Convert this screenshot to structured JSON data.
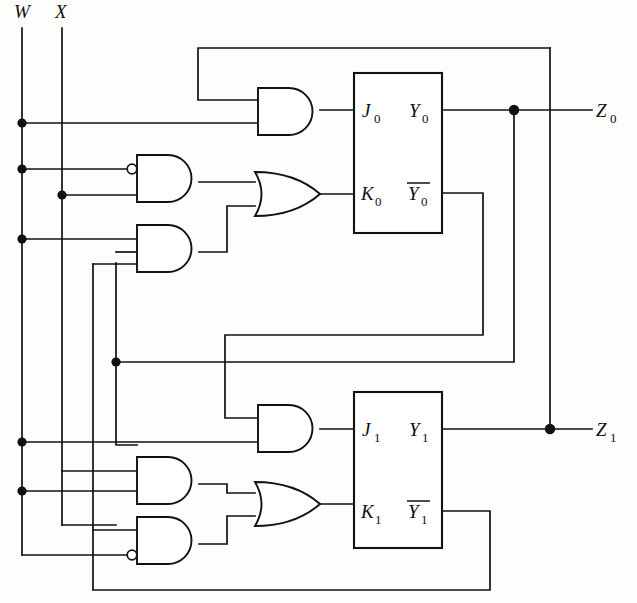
{
  "diagram": {
    "type": "logic-schematic",
    "background_color": "#fdfdfb",
    "line_color": "#111111"
  },
  "inputs": [
    {
      "id": "W",
      "label": "W",
      "x": 22,
      "label_x": 14,
      "label_y": 18
    },
    {
      "id": "X",
      "label": "X",
      "x": 62,
      "label_x": 55,
      "label_y": 18
    }
  ],
  "outputs": [
    {
      "id": "Z0",
      "label": "Z",
      "sub": "0",
      "x": 592,
      "y": 110
    },
    {
      "id": "Z1",
      "label": "Z",
      "sub": "1",
      "x": 592,
      "y": 429
    }
  ],
  "flipflops": [
    {
      "id": "ff0",
      "index": "0",
      "pins": {
        "j": "J",
        "j_sub": "0",
        "k": "K",
        "k_sub": "0",
        "q": "Y",
        "q_sub": "0",
        "qbar": "Y",
        "qbar_sub": "0",
        "qbar_overbar": true
      },
      "box": {
        "x": 354,
        "y": 73,
        "w": 88,
        "h": 160
      },
      "pin_y": {
        "j": 110,
        "k": 193,
        "q": 110,
        "qbar": 193
      }
    },
    {
      "id": "ff1",
      "index": "1",
      "pins": {
        "j": "J",
        "j_sub": "1",
        "k": "K",
        "k_sub": "1",
        "q": "Y",
        "q_sub": "1",
        "qbar": "Y",
        "qbar_sub": "1",
        "qbar_overbar": true
      },
      "box": {
        "x": 354,
        "y": 392,
        "w": 88,
        "h": 156
      },
      "pin_y": {
        "j": 429,
        "k": 511,
        "q": 429,
        "qbar": 511
      }
    }
  ],
  "gates": [
    {
      "id": "and-j0",
      "type": "AND",
      "x": 258,
      "y": 88,
      "w": 62,
      "h": 47,
      "inverted_inputs": [],
      "out_to": "J0"
    },
    {
      "id": "and-a",
      "type": "AND",
      "x": 137,
      "y": 155,
      "w": 62,
      "h": 47,
      "inverted_inputs": [
        "top"
      ],
      "out_to": "or-k0"
    },
    {
      "id": "and-b",
      "type": "AND",
      "x": 137,
      "y": 225,
      "w": 62,
      "h": 47,
      "inverted_inputs": [],
      "out_to": "or-k0"
    },
    {
      "id": "or-k0",
      "type": "OR",
      "x": 255,
      "y": 172,
      "w": 65,
      "h": 44,
      "inverted_inputs": [],
      "out_to": "K0"
    },
    {
      "id": "and-j1",
      "type": "AND",
      "x": 258,
      "y": 405,
      "w": 62,
      "h": 47,
      "inverted_inputs": [],
      "out_to": "J1"
    },
    {
      "id": "and-c",
      "type": "AND",
      "x": 137,
      "y": 457,
      "w": 62,
      "h": 47,
      "inverted_inputs": [],
      "out_to": "or-k1"
    },
    {
      "id": "and-d",
      "type": "AND",
      "x": 137,
      "y": 517,
      "w": 62,
      "h": 47,
      "inverted_inputs": [
        "bottom"
      ],
      "out_to": "or-k1"
    },
    {
      "id": "or-k1",
      "type": "OR",
      "x": 255,
      "y": 482,
      "w": 65,
      "h": 44,
      "inverted_inputs": [],
      "out_to": "K1"
    }
  ],
  "junctions": [
    {
      "id": "w-j0",
      "x": 22,
      "y": 123
    },
    {
      "id": "w-j1",
      "x": 22,
      "y": 169
    },
    {
      "id": "w-j2",
      "x": 22,
      "y": 239
    },
    {
      "id": "w-j3",
      "x": 22,
      "y": 442
    },
    {
      "id": "w-j4",
      "x": 22,
      "y": 491
    },
    {
      "id": "x-j0",
      "x": 62,
      "y": 195
    },
    {
      "id": "fb-y0",
      "x": 116,
      "y": 362
    },
    {
      "id": "z0-tap",
      "x": 514,
      "y": 110
    },
    {
      "id": "z1-tap",
      "x": 550,
      "y": 429
    }
  ],
  "nets": {
    "w_bus_end_y": 555,
    "x_bus_end_y": 525,
    "feedback_ybar1_y": 590,
    "feedback_y0_y": 362,
    "feedback_ybar0_y": 335,
    "top_feedback_y": 48
  }
}
